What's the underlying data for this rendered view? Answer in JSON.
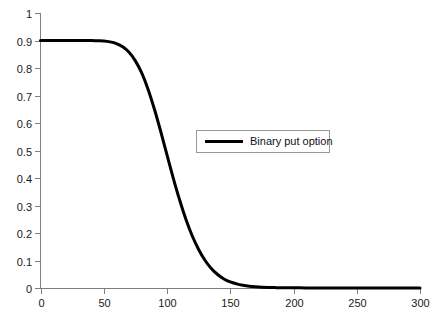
{
  "chart_data": {
    "type": "line",
    "title": "",
    "subtitle": "",
    "xlabel": "",
    "ylabel": "",
    "xlim": [
      0,
      300
    ],
    "ylim": [
      0,
      1
    ],
    "grid": false,
    "legend_position": "center-right-upper",
    "x_ticks": [
      0,
      50,
      100,
      150,
      200,
      250,
      300
    ],
    "x_tick_labels": [
      "0",
      "50",
      "100",
      "150",
      "200",
      "250",
      "300"
    ],
    "y_ticks": [
      0,
      0.1,
      0.2,
      0.3,
      0.4,
      0.5,
      0.6,
      0.7,
      0.8,
      0.9,
      1
    ],
    "y_tick_labels": [
      "0",
      "0.1",
      "0.2",
      "0.3",
      "0.4",
      "0.5",
      "0.6",
      "0.7",
      "0.8",
      "0.9",
      "1"
    ],
    "series": [
      {
        "name": "Binary put option",
        "color": "#000000",
        "x": [
          0,
          5,
          10,
          15,
          20,
          25,
          30,
          35,
          40,
          45,
          50,
          55,
          60,
          65,
          70,
          75,
          80,
          85,
          90,
          95,
          100,
          105,
          110,
          115,
          120,
          125,
          130,
          135,
          140,
          145,
          150,
          155,
          160,
          165,
          170,
          175,
          180,
          185,
          190,
          200,
          210,
          220,
          230,
          240,
          250,
          260,
          270,
          280,
          290,
          300
        ],
        "values": [
          0.9,
          0.9,
          0.9,
          0.9,
          0.9,
          0.9,
          0.9,
          0.9,
          0.9,
          0.899,
          0.898,
          0.895,
          0.889,
          0.877,
          0.857,
          0.826,
          0.782,
          0.723,
          0.651,
          0.57,
          0.484,
          0.399,
          0.32,
          0.249,
          0.189,
          0.14,
          0.101,
          0.071,
          0.049,
          0.033,
          0.022,
          0.015,
          0.01,
          0.0065,
          0.0043,
          0.0029,
          0.002,
          0.0014,
          0.001,
          0.0006,
          0.0004,
          0.0003,
          0.0002,
          0.0002,
          0.0001,
          0.0001,
          0.0001,
          0.0,
          0.0,
          0.0
        ]
      }
    ]
  },
  "legend": {
    "entries": [
      {
        "label": "Binary put option"
      }
    ]
  }
}
